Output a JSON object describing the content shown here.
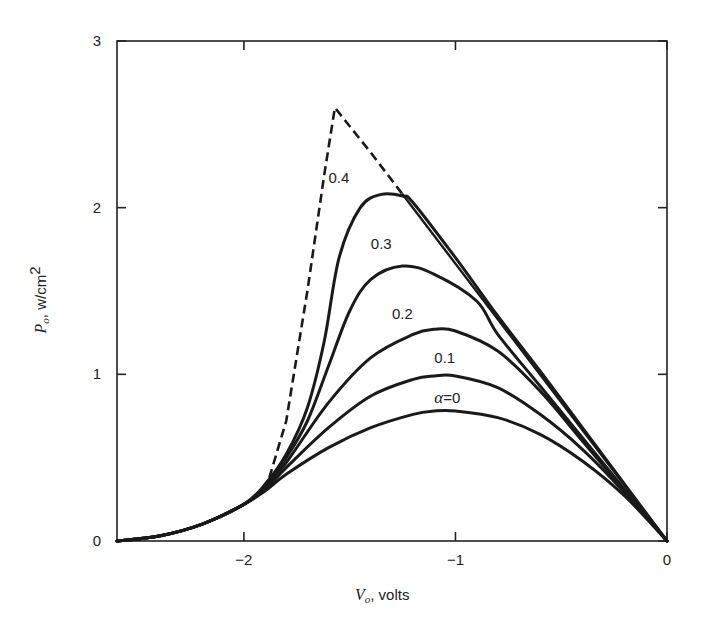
{
  "chart_data": {
    "type": "line",
    "title": "",
    "xlabel": "V_o, volts",
    "ylabel": "P_o, w/cm^2",
    "xlabel_parts": {
      "symbol": "V",
      "sub": "o",
      "unit": ", volts"
    },
    "ylabel_parts": {
      "symbol": "P",
      "sub": "o",
      "unit": ", w/cm",
      "sup": "2"
    },
    "xlim": [
      -2.6,
      0
    ],
    "ylim": [
      0,
      3
    ],
    "x_ticks": [
      -2,
      -1,
      0
    ],
    "x_tick_labels": [
      "−2",
      "−1",
      "0"
    ],
    "y_ticks": [
      0,
      1,
      2,
      3
    ],
    "y_tick_labels": [
      "0",
      "1",
      "2",
      "3"
    ],
    "grid": false,
    "legend": "inline curve labels",
    "series": [
      {
        "name": "α = 0",
        "label": "α = 0",
        "style": "solid",
        "x": [
          -2.6,
          -2.4,
          -2.2,
          -2.0,
          -1.9,
          -1.8,
          -1.6,
          -1.4,
          -1.2,
          -1.1,
          -1.0,
          -0.8,
          -0.6,
          -0.4,
          -0.2,
          0.0
        ],
        "y": [
          0.0,
          0.03,
          0.1,
          0.22,
          0.3,
          0.4,
          0.56,
          0.68,
          0.76,
          0.78,
          0.78,
          0.74,
          0.64,
          0.48,
          0.27,
          0.0
        ]
      },
      {
        "name": "0.1",
        "label": "0.1",
        "style": "solid",
        "x": [
          -2.6,
          -2.4,
          -2.2,
          -2.0,
          -1.9,
          -1.8,
          -1.6,
          -1.4,
          -1.2,
          -1.1,
          -1.0,
          -0.8,
          -0.6,
          -0.4,
          -0.2,
          0.0
        ],
        "y": [
          0.0,
          0.03,
          0.1,
          0.22,
          0.31,
          0.44,
          0.68,
          0.87,
          0.97,
          0.99,
          0.99,
          0.92,
          0.76,
          0.55,
          0.29,
          0.0
        ]
      },
      {
        "name": "0.2",
        "label": "0.2",
        "style": "solid",
        "x": [
          -2.6,
          -2.4,
          -2.2,
          -2.0,
          -1.9,
          -1.8,
          -1.6,
          -1.4,
          -1.2,
          -1.1,
          -1.0,
          -0.8,
          -0.6,
          -0.4,
          -0.2,
          0.0
        ],
        "y": [
          0.0,
          0.03,
          0.1,
          0.22,
          0.32,
          0.47,
          0.83,
          1.1,
          1.24,
          1.27,
          1.26,
          1.14,
          0.9,
          0.6,
          0.3,
          0.0
        ]
      },
      {
        "name": "0.3",
        "label": "0.3",
        "style": "solid",
        "x": [
          -2.6,
          -2.4,
          -2.2,
          -2.0,
          -1.9,
          -1.8,
          -1.7,
          -1.6,
          -1.5,
          -1.4,
          -1.25,
          -1.1,
          -0.9,
          -0.8,
          -0.6,
          -0.4,
          -0.2,
          0.0
        ],
        "y": [
          0.0,
          0.03,
          0.1,
          0.22,
          0.33,
          0.5,
          0.72,
          1.05,
          1.38,
          1.57,
          1.65,
          1.6,
          1.44,
          1.24,
          0.93,
          0.62,
          0.31,
          0.0
        ]
      },
      {
        "name": "0.4",
        "label": "0.4",
        "style": "solid",
        "x": [
          -2.6,
          -2.4,
          -2.2,
          -2.0,
          -1.9,
          -1.8,
          -1.7,
          -1.62,
          -1.55,
          -1.45,
          -1.35,
          -1.25,
          -1.2,
          -1.0,
          -0.8,
          -0.6,
          -0.4,
          -0.2,
          0.0
        ],
        "y": [
          0.0,
          0.03,
          0.1,
          0.22,
          0.34,
          0.52,
          0.8,
          1.2,
          1.7,
          2.0,
          2.08,
          2.07,
          2.03,
          1.7,
          1.35,
          1.02,
          0.68,
          0.34,
          0.0
        ]
      },
      {
        "name": "envelope (dashed)",
        "label": "",
        "style": "dashed",
        "x": [
          -1.88,
          -1.8,
          -1.7,
          -1.62,
          -1.57,
          -1.4,
          -1.25
        ],
        "y": [
          0.38,
          0.72,
          1.5,
          2.2,
          2.6,
          2.33,
          2.08
        ]
      },
      {
        "name": "envelope (solid tangent)",
        "label": "",
        "style": "solid",
        "x": [
          -1.25,
          0.0
        ],
        "y": [
          2.08,
          0.0
        ]
      }
    ],
    "annotations": [
      {
        "text": "0.4",
        "x": -1.6,
        "y": 2.15
      },
      {
        "text": "0.3",
        "x": -1.4,
        "y": 1.75
      },
      {
        "text": "0.2",
        "x": -1.3,
        "y": 1.33
      },
      {
        "text": "0.1",
        "x": -1.1,
        "y": 1.07
      },
      {
        "text": "α = 0",
        "x": -1.1,
        "y": 0.83
      }
    ]
  }
}
